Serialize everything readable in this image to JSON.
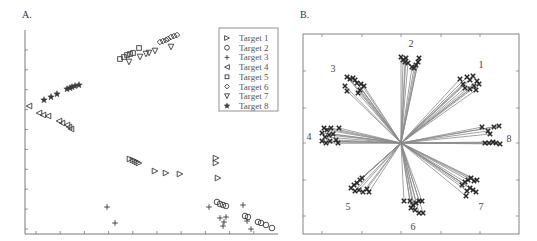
{
  "panels": {
    "a_label": "A.",
    "b_label": "B."
  },
  "chart_data": [
    {
      "type": "scatter",
      "title": "A.",
      "xlabel": "",
      "ylabel": "",
      "grid": false,
      "legend_position": "top-right",
      "axis_ticks": {
        "x_count": 10,
        "y_count": 10,
        "tick_labels": "none"
      },
      "legend": [
        "Target 1",
        "Target 2",
        "Target 3",
        "Target 4",
        "Target 5",
        "Target 6",
        "Target 7",
        "Target 8"
      ],
      "marker_map": {
        "Target 1": "triangle-right",
        "Target 2": "circle",
        "Target 3": "plus",
        "Target 4": "triangle-left",
        "Target 5": "square",
        "Target 6": "diamond",
        "Target 7": "triangle-down",
        "Target 8": "star"
      },
      "pixel_frame": {
        "x0": 25,
        "y0": 30,
        "x1": 278,
        "y1": 234
      },
      "series": [
        {
          "name": "Target 1",
          "points_px": [
            [
              130,
              159
            ],
            [
              133,
              160
            ],
            [
              135,
              161
            ],
            [
              137,
              162
            ],
            [
              139,
              163
            ],
            [
              155,
              171
            ],
            [
              166,
              173
            ],
            [
              180,
              174
            ],
            [
              216,
              158
            ],
            [
              216,
              163
            ],
            [
              218,
              178
            ]
          ]
        },
        {
          "name": "Target 2",
          "points_px": [
            [
              217,
              202
            ],
            [
              220,
              204
            ],
            [
              223,
              205
            ],
            [
              226,
              206
            ],
            [
              245,
              216
            ],
            [
              248,
              217
            ],
            [
              258,
              222
            ],
            [
              261,
              223
            ],
            [
              266,
              225
            ],
            [
              272,
              228
            ]
          ]
        },
        {
          "name": "Target 3",
          "points_px": [
            [
              107,
              207
            ],
            [
              115,
              223
            ],
            [
              209,
              207
            ],
            [
              220,
              218
            ],
            [
              226,
              217
            ],
            [
              224,
              222
            ],
            [
              223,
              226
            ],
            [
              243,
              205
            ],
            [
              247,
              221
            ],
            [
              251,
              229
            ]
          ]
        },
        {
          "name": "Target 4",
          "points_px": [
            [
              29,
              106
            ],
            [
              39,
              113
            ],
            [
              43,
              115
            ],
            [
              48,
              116
            ],
            [
              59,
              121
            ],
            [
              62,
              123
            ],
            [
              67,
              125
            ],
            [
              69,
              127
            ],
            [
              71,
              129
            ]
          ]
        },
        {
          "name": "Target 5",
          "points_px": [
            [
              120,
              59
            ],
            [
              124,
              57
            ],
            [
              127,
              55
            ],
            [
              130,
              54
            ],
            [
              133,
              53
            ],
            [
              139,
              48
            ]
          ]
        },
        {
          "name": "Target 6",
          "points_px": [
            [
              160,
              42
            ],
            [
              163,
              41
            ],
            [
              166,
              40
            ],
            [
              168,
              39
            ],
            [
              171,
              37
            ],
            [
              174,
              36
            ],
            [
              177,
              35
            ]
          ]
        },
        {
          "name": "Target 7",
          "points_px": [
            [
              129,
              62
            ],
            [
              140,
              57
            ],
            [
              146,
              54
            ],
            [
              149,
              53
            ],
            [
              155,
              51
            ],
            [
              171,
              47
            ]
          ]
        },
        {
          "name": "Target 8",
          "points_px": [
            [
              44,
              100
            ],
            [
              51,
              97
            ],
            [
              57,
              94
            ],
            [
              67,
              89
            ],
            [
              70,
              88
            ],
            [
              72,
              87
            ],
            [
              75,
              86
            ],
            [
              79,
              85
            ]
          ]
        }
      ]
    },
    {
      "type": "scatter",
      "title": "B.",
      "subtype": "radial-vectors",
      "xlabel": "",
      "ylabel": "",
      "grid": false,
      "axis_ticks": {
        "x_count": 5,
        "y_count": 5,
        "tick_labels": "none"
      },
      "pixel_frame": {
        "x0": 303,
        "y0": 34,
        "x1": 519,
        "y1": 234
      },
      "origin_px": [
        401,
        143
      ],
      "direction_labels": [
        {
          "label": "1",
          "pos": [
            481,
            68
          ]
        },
        {
          "label": "2",
          "pos": [
            411,
            47
          ]
        },
        {
          "label": "3",
          "pos": [
            333,
            72
          ]
        },
        {
          "label": "4",
          "pos": [
            309,
            140
          ]
        },
        {
          "label": "5",
          "pos": [
            348,
            210
          ]
        },
        {
          "label": "6",
          "pos": [
            413,
            230
          ]
        },
        {
          "label": "7",
          "pos": [
            481,
            210
          ]
        },
        {
          "label": "8",
          "pos": [
            509,
            142
          ]
        }
      ],
      "clusters": [
        {
          "target": "1",
          "points_px": [
            [
              460,
              79
            ],
            [
              463,
              84
            ],
            [
              467,
              77
            ],
            [
              470,
              80
            ],
            [
              473,
              76
            ],
            [
              474,
              86
            ],
            [
              476,
              90
            ],
            [
              477,
              81
            ],
            [
              479,
              84
            ],
            [
              470,
              89
            ],
            [
              465,
              88
            ]
          ]
        },
        {
          "target": "2",
          "points_px": [
            [
              401,
              57
            ],
            [
              403,
              60
            ],
            [
              405,
              62
            ],
            [
              406,
              58
            ],
            [
              408,
              63
            ],
            [
              412,
              67
            ],
            [
              414,
              68
            ],
            [
              416,
              65
            ],
            [
              418,
              62
            ],
            [
              419,
              58
            ]
          ]
        },
        {
          "target": "3",
          "points_px": [
            [
              347,
              77
            ],
            [
              350,
              79
            ],
            [
              353,
              78
            ],
            [
              355,
              80
            ],
            [
              357,
              83
            ],
            [
              345,
              86
            ],
            [
              347,
              91
            ],
            [
              361,
              84
            ],
            [
              364,
              86
            ],
            [
              360,
              90
            ],
            [
              358,
              93
            ]
          ]
        },
        {
          "target": "4",
          "points_px": [
            [
              324,
              128
            ],
            [
              327,
              130
            ],
            [
              331,
              128
            ],
            [
              322,
              133
            ],
            [
              325,
              137
            ],
            [
              329,
              135
            ],
            [
              333,
              134
            ],
            [
              322,
              141
            ],
            [
              326,
              143
            ],
            [
              330,
              141
            ],
            [
              336,
              140
            ],
            [
              338,
              143
            ],
            [
              339,
              128
            ]
          ]
        },
        {
          "target": "5",
          "points_px": [
            [
              351,
              188
            ],
            [
              354,
              185
            ],
            [
              357,
              183
            ],
            [
              360,
              180
            ],
            [
              362,
              178
            ],
            [
              359,
              190
            ],
            [
              363,
              192
            ],
            [
              367,
              189
            ],
            [
              369,
              192
            ],
            [
              355,
              191
            ]
          ]
        },
        {
          "target": "6",
          "points_px": [
            [
              404,
              201
            ],
            [
              410,
              201
            ],
            [
              413,
              205
            ],
            [
              416,
              203
            ],
            [
              419,
              201
            ],
            [
              422,
              201
            ],
            [
              411,
              208
            ],
            [
              415,
              210
            ],
            [
              419,
              213
            ],
            [
              423,
              213
            ]
          ]
        },
        {
          "target": "7",
          "points_px": [
            [
              462,
              185
            ],
            [
              465,
              182
            ],
            [
              468,
              180
            ],
            [
              471,
              178
            ],
            [
              474,
              181
            ],
            [
              477,
              180
            ],
            [
              467,
              191
            ],
            [
              470,
              188
            ],
            [
              473,
              190
            ],
            [
              476,
              192
            ],
            [
              466,
              196
            ]
          ]
        },
        {
          "target": "8",
          "points_px": [
            [
              482,
              127
            ],
            [
              488,
              131
            ],
            [
              490,
              134
            ],
            [
              494,
              127
            ],
            [
              499,
              126
            ],
            [
              485,
              143
            ],
            [
              489,
              143
            ],
            [
              493,
              142
            ],
            [
              496,
              143
            ],
            [
              500,
              144
            ]
          ]
        }
      ]
    }
  ]
}
